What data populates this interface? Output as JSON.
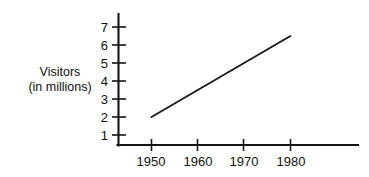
{
  "chart_data": {
    "type": "line",
    "title": "",
    "xlabel": "",
    "ylabel": "Visitors (in millions)",
    "ylabel_line1": "Visitors",
    "ylabel_line2": "(in millions)",
    "x": [
      1950,
      1980
    ],
    "values": [
      2,
      6.5
    ],
    "series": [
      {
        "name": "Visitors",
        "x": [
          1950,
          1980
        ],
        "values": [
          2,
          6.5
        ]
      }
    ],
    "xticks": [
      1950,
      1960,
      1970,
      1980
    ],
    "xtick_labels": [
      "1950",
      "1960",
      "1970",
      "1980"
    ],
    "yticks": [
      1,
      2,
      3,
      4,
      5,
      6,
      7
    ],
    "ytick_labels": [
      "1",
      "2",
      "3",
      "4",
      "5",
      "6",
      "7"
    ],
    "xlim": [
      1945,
      1995
    ],
    "ylim": [
      0.5,
      7.6
    ],
    "grid": false,
    "legend": false,
    "line_color": "#1a1a1a",
    "axis_color": "#141414",
    "background": "#ffffff"
  },
  "axis_labels": {
    "y_line1": "Visitors",
    "y_line2": "(in millions)"
  },
  "ticks": {
    "y": [
      "7",
      "6",
      "5",
      "4",
      "3",
      "2",
      "1"
    ],
    "x": [
      "1950",
      "1960",
      "1970",
      "1980"
    ]
  }
}
